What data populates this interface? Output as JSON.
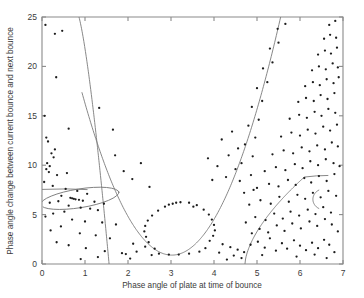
{
  "figure": {
    "background_color": "#ffffff",
    "axis_color": "#8a8a8a",
    "curve_color": "#7a7a7a",
    "point_color": "#1c1c1c"
  },
  "chart_data": {
    "type": "scatter",
    "title": "",
    "xlabel": "Phase angle of plate at time of bounce",
    "ylabel": "Phase angle change between current bounce and next bounce",
    "xlim": [
      0,
      7
    ],
    "ylim": [
      0,
      25
    ],
    "xticks": [
      0,
      1,
      2,
      3,
      4,
      5,
      6,
      7
    ],
    "xticklabels": [
      "0",
      "1",
      "2",
      "3",
      "4",
      "5",
      "6",
      "7"
    ],
    "yticks": [
      0,
      5,
      10,
      15,
      20,
      25
    ],
    "yticklabels": [
      "0",
      "5",
      "10",
      "15",
      "20",
      "25"
    ],
    "grid": false,
    "legend": null,
    "marker": "dot",
    "marker_size": 1.15,
    "points": [
      [
        0.08,
        24.2
      ],
      [
        0.3,
        23.3
      ],
      [
        0.47,
        23.6
      ],
      [
        0.33,
        18.9
      ],
      [
        0.06,
        15.0
      ],
      [
        1.33,
        15.8
      ],
      [
        0.62,
        13.7
      ],
      [
        1.65,
        13.6
      ],
      [
        0.1,
        12.8
      ],
      [
        0.14,
        12.4
      ],
      [
        0.3,
        11.6
      ],
      [
        0.22,
        11.2
      ],
      [
        0.27,
        10.8
      ],
      [
        0.12,
        10.2
      ],
      [
        0.18,
        9.9
      ],
      [
        0.1,
        9.6
      ],
      [
        0.16,
        9.3
      ],
      [
        0.35,
        9.0
      ],
      [
        0.58,
        9.2
      ],
      [
        0.05,
        8.3
      ],
      [
        0.25,
        7.9
      ],
      [
        0.55,
        7.6
      ],
      [
        0.82,
        7.4
      ],
      [
        1.05,
        7.1
      ],
      [
        0.45,
        6.9
      ],
      [
        0.7,
        6.65
      ],
      [
        0.74,
        6.6
      ],
      [
        0.78,
        6.55
      ],
      [
        0.66,
        6.7
      ],
      [
        0.86,
        6.5
      ],
      [
        0.95,
        6.4
      ],
      [
        1.22,
        6.3
      ],
      [
        1.44,
        6.1
      ],
      [
        0.38,
        6.35
      ],
      [
        0.18,
        6.2
      ],
      [
        0.62,
        5.9
      ],
      [
        0.9,
        5.7
      ],
      [
        1.12,
        5.6
      ],
      [
        1.3,
        5.45
      ],
      [
        0.52,
        5.3
      ],
      [
        0.26,
        5.1
      ],
      [
        0.08,
        4.8
      ],
      [
        0.7,
        4.5
      ],
      [
        1.0,
        4.3
      ],
      [
        1.4,
        4.2
      ],
      [
        1.72,
        4.0
      ],
      [
        0.44,
        3.8
      ],
      [
        0.2,
        3.4
      ],
      [
        0.88,
        3.1
      ],
      [
        1.25,
        2.9
      ],
      [
        1.58,
        2.6
      ],
      [
        0.34,
        2.2
      ],
      [
        0.62,
        1.9
      ],
      [
        1.02,
        1.6
      ],
      [
        1.46,
        1.3
      ],
      [
        1.86,
        1.1
      ],
      [
        2.2,
        1.25
      ],
      [
        2.55,
        0.9
      ],
      [
        1.3,
        0.7
      ],
      [
        0.9,
        0.5
      ],
      [
        2.12,
        2.05
      ],
      [
        2.4,
        1.75
      ],
      [
        2.05,
        0.55
      ],
      [
        1.95,
        1.0
      ],
      [
        2.72,
        1.05
      ],
      [
        2.95,
        0.95
      ],
      [
        3.18,
        0.95
      ],
      [
        3.42,
        1.05
      ],
      [
        3.66,
        1.25
      ],
      [
        2.62,
        1.55
      ],
      [
        3.8,
        1.6
      ],
      [
        2.48,
        2.2
      ],
      [
        3.9,
        2.35
      ],
      [
        2.42,
        2.75
      ],
      [
        3.98,
        2.85
      ],
      [
        2.38,
        3.3
      ],
      [
        4.02,
        3.4
      ],
      [
        2.4,
        3.85
      ],
      [
        4.0,
        3.95
      ],
      [
        2.46,
        4.4
      ],
      [
        3.95,
        4.5
      ],
      [
        2.56,
        4.9
      ],
      [
        3.88,
        5.0
      ],
      [
        2.7,
        5.4
      ],
      [
        3.76,
        5.5
      ],
      [
        2.86,
        5.8
      ],
      [
        3.6,
        5.95
      ],
      [
        3.04,
        6.1
      ],
      [
        3.42,
        6.2
      ],
      [
        3.22,
        6.25
      ],
      [
        3.12,
        6.2
      ],
      [
        2.95,
        6.0
      ],
      [
        3.52,
        5.8
      ],
      [
        4.2,
        2.0
      ],
      [
        4.38,
        1.7
      ],
      [
        4.55,
        1.45
      ],
      [
        4.7,
        1.2
      ],
      [
        4.12,
        1.15
      ],
      [
        4.46,
        0.85
      ],
      [
        4.64,
        0.6
      ],
      [
        4.3,
        0.45
      ],
      [
        4.85,
        1.95
      ],
      [
        5.02,
        2.25
      ],
      [
        5.18,
        1.65
      ],
      [
        5.3,
        2.6
      ],
      [
        5.44,
        1.35
      ],
      [
        5.58,
        2.1
      ],
      [
        5.7,
        1.55
      ],
      [
        5.86,
        2.4
      ],
      [
        6.0,
        1.85
      ],
      [
        6.14,
        1.4
      ],
      [
        6.28,
        2.15
      ],
      [
        6.42,
        1.6
      ],
      [
        6.56,
        2.45
      ],
      [
        6.68,
        1.95
      ],
      [
        6.8,
        1.2
      ],
      [
        5.12,
        0.9
      ],
      [
        5.92,
        0.75
      ],
      [
        6.34,
        0.95
      ],
      [
        6.62,
        0.6
      ],
      [
        4.88,
        3.1
      ],
      [
        5.06,
        3.55
      ],
      [
        5.26,
        3.2
      ],
      [
        5.46,
        3.9
      ],
      [
        5.64,
        3.35
      ],
      [
        5.82,
        4.1
      ],
      [
        6.02,
        3.6
      ],
      [
        6.22,
        4.3
      ],
      [
        6.4,
        3.85
      ],
      [
        6.58,
        4.55
      ],
      [
        6.74,
        4.0
      ],
      [
        6.88,
        3.3
      ],
      [
        4.74,
        4.2
      ],
      [
        4.96,
        4.75
      ],
      [
        5.2,
        4.45
      ],
      [
        5.4,
        5.1
      ],
      [
        5.6,
        4.6
      ],
      [
        5.78,
        5.3
      ],
      [
        5.98,
        4.9
      ],
      [
        6.18,
        5.5
      ],
      [
        6.36,
        5.05
      ],
      [
        6.54,
        5.75
      ],
      [
        6.72,
        5.2
      ],
      [
        4.82,
        6.0
      ],
      [
        5.08,
        6.45
      ],
      [
        5.32,
        6.1
      ],
      [
        5.52,
        6.8
      ],
      [
        5.74,
        6.3
      ],
      [
        5.94,
        7.0
      ],
      [
        6.12,
        6.6
      ],
      [
        6.3,
        7.2
      ],
      [
        6.48,
        6.75
      ],
      [
        6.66,
        7.4
      ],
      [
        6.84,
        6.9
      ],
      [
        5.0,
        7.7
      ],
      [
        5.28,
        8.1
      ],
      [
        5.5,
        7.85
      ],
      [
        5.72,
        8.5
      ],
      [
        5.9,
        8.0
      ],
      [
        6.1,
        8.7
      ],
      [
        6.26,
        8.25
      ],
      [
        6.44,
        8.9
      ],
      [
        6.62,
        8.4
      ],
      [
        6.8,
        9.1
      ],
      [
        5.18,
        9.4
      ],
      [
        5.44,
        9.8
      ],
      [
        5.66,
        9.5
      ],
      [
        5.88,
        10.1
      ],
      [
        6.06,
        9.7
      ],
      [
        6.24,
        10.4
      ],
      [
        6.42,
        10.0
      ],
      [
        6.6,
        10.6
      ],
      [
        6.78,
        10.2
      ],
      [
        6.92,
        9.9
      ],
      [
        5.36,
        11.1
      ],
      [
        5.62,
        11.5
      ],
      [
        5.84,
        11.2
      ],
      [
        6.04,
        11.8
      ],
      [
        6.22,
        11.4
      ],
      [
        6.4,
        12.0
      ],
      [
        6.58,
        11.6
      ],
      [
        6.74,
        12.3
      ],
      [
        6.88,
        11.9
      ],
      [
        5.56,
        12.9
      ],
      [
        5.8,
        13.3
      ],
      [
        6.0,
        13.0
      ],
      [
        6.18,
        13.6
      ],
      [
        6.36,
        13.2
      ],
      [
        6.54,
        13.9
      ],
      [
        6.7,
        13.5
      ],
      [
        6.86,
        14.1
      ],
      [
        5.76,
        14.7
      ],
      [
        5.98,
        15.1
      ],
      [
        6.16,
        14.8
      ],
      [
        6.34,
        15.4
      ],
      [
        6.5,
        15.0
      ],
      [
        6.66,
        15.7
      ],
      [
        6.82,
        15.3
      ],
      [
        5.96,
        16.4
      ],
      [
        6.14,
        16.8
      ],
      [
        6.32,
        16.5
      ],
      [
        6.48,
        17.1
      ],
      [
        6.64,
        16.7
      ],
      [
        6.8,
        17.3
      ],
      [
        6.12,
        18.0
      ],
      [
        6.3,
        18.4
      ],
      [
        6.46,
        18.1
      ],
      [
        6.62,
        18.7
      ],
      [
        6.78,
        18.3
      ],
      [
        6.9,
        18.9
      ],
      [
        6.28,
        19.6
      ],
      [
        6.44,
        20.0
      ],
      [
        6.6,
        19.7
      ],
      [
        6.76,
        20.3
      ],
      [
        6.88,
        19.9
      ],
      [
        6.42,
        21.2
      ],
      [
        6.58,
        21.6
      ],
      [
        6.72,
        21.3
      ],
      [
        6.86,
        21.9
      ],
      [
        6.56,
        22.8
      ],
      [
        6.7,
        23.2
      ],
      [
        6.84,
        22.9
      ],
      [
        6.68,
        24.2
      ],
      [
        6.82,
        24.6
      ],
      [
        4.7,
        7.2
      ],
      [
        4.92,
        7.5
      ],
      [
        4.6,
        8.4
      ],
      [
        4.86,
        9.0
      ],
      [
        4.64,
        10.2
      ],
      [
        4.9,
        10.9
      ],
      [
        4.72,
        12.1
      ],
      [
        4.96,
        12.8
      ],
      [
        4.8,
        14.0
      ],
      [
        5.04,
        14.6
      ],
      [
        4.88,
        15.9
      ],
      [
        5.12,
        16.5
      ],
      [
        5.0,
        17.8
      ],
      [
        5.24,
        18.4
      ],
      [
        5.14,
        19.8
      ],
      [
        5.36,
        20.4
      ],
      [
        5.3,
        21.8
      ],
      [
        5.5,
        22.4
      ],
      [
        5.48,
        23.8
      ],
      [
        5.66,
        24.3
      ],
      [
        4.28,
        8.8
      ],
      [
        4.5,
        9.6
      ],
      [
        4.34,
        11.0
      ],
      [
        4.56,
        11.7
      ],
      [
        4.18,
        12.6
      ],
      [
        4.42,
        13.4
      ],
      [
        3.96,
        8.5
      ],
      [
        4.08,
        9.9
      ],
      [
        3.86,
        10.7
      ],
      [
        2.1,
        8.6
      ],
      [
        1.9,
        9.4
      ],
      [
        2.3,
        10.2
      ],
      [
        1.7,
        11.0
      ],
      [
        2.5,
        7.8
      ]
    ],
    "curves": [
      {
        "name": "central-parabola",
        "description": "Large upward parabola with minimum near x=3.0, y=0.9",
        "vertex": [
          3.02,
          0.9
        ],
        "y_at_x_left_top": 25,
        "x_left_at_top": 1.18,
        "x_right_at_top": 5.55
      },
      {
        "name": "descending-branch-left",
        "description": "Steep curve descending from top edge at x=0.81 to x-axis at x=1.56",
        "x_at_ytop": 0.81,
        "x_at_ybottom": 1.56
      },
      {
        "name": "rising-branch-right",
        "description": "Curve rising from x-axis at x=4.72 to plateau near y=8.8 at x=6.1",
        "x_at_ybottom": 4.72,
        "plateau": [
          6.1,
          8.8
        ]
      },
      {
        "name": "left-ellipse",
        "description": "Tilted ellipse enclosing dense cluster, center x=0.88 y=6.65",
        "center": [
          0.88,
          6.65
        ],
        "rx": 0.92,
        "ry": 0.95,
        "rotation_deg": -9
      },
      {
        "name": "horizontal-segment",
        "description": "Short horizontal line at y=7.55 spanning x=0 to x=1.05",
        "y": 7.55,
        "x_start": 0.0,
        "x_end": 1.05
      },
      {
        "name": "right-hook",
        "description": "Small C-shaped hook opening right near x=6.2, y=6.6",
        "center": [
          6.3,
          6.55
        ],
        "opening": "right"
      }
    ]
  }
}
